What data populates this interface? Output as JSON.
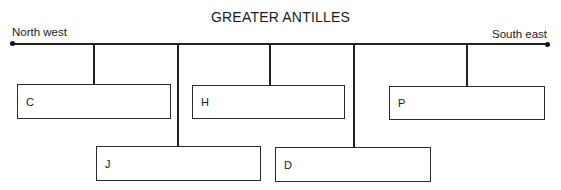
{
  "diagram": {
    "title": "GREATER ANTILLES",
    "axis": {
      "left_label": "North west",
      "right_label": "South east"
    },
    "boxes": [
      {
        "id": "C",
        "label": "C"
      },
      {
        "id": "H",
        "label": "H"
      },
      {
        "id": "P",
        "label": "P"
      },
      {
        "id": "J",
        "label": "J"
      },
      {
        "id": "D",
        "label": "D"
      }
    ]
  }
}
